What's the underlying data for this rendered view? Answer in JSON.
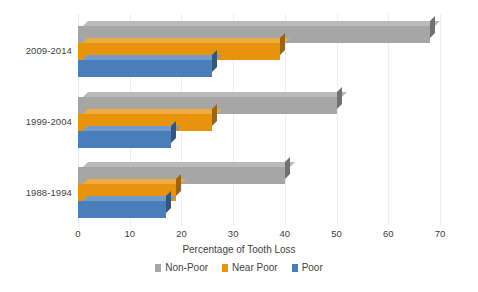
{
  "chart_data": {
    "type": "bar",
    "orientation": "horizontal",
    "title": "",
    "xlabel": "Percentage of Tooth Loss",
    "ylabel": "",
    "xlim": [
      0,
      70
    ],
    "xticks": [
      0,
      10,
      20,
      30,
      40,
      50,
      60,
      70
    ],
    "grid": true,
    "legend_position": "bottom",
    "categories": [
      "2009-2014",
      "1999-2004",
      "1988-1994"
    ],
    "series": [
      {
        "name": "Non-Poor",
        "color": "#a6a6a6",
        "values": [
          68,
          50,
          40
        ]
      },
      {
        "name": "Near Poor",
        "color": "#e8930c",
        "values": [
          39,
          26,
          19
        ]
      },
      {
        "name": "Poor",
        "color": "#4a7ebb",
        "values": [
          26,
          18,
          17
        ]
      }
    ]
  },
  "axis": {
    "tick_labels": [
      "0",
      "10",
      "20",
      "30",
      "40",
      "50",
      "60",
      "70"
    ],
    "title": "Percentage of Tooth Loss"
  },
  "categories": {
    "labels": [
      "2009-2014",
      "1999-2004",
      "1988-1994"
    ]
  },
  "legend": {
    "items": [
      {
        "label": "Non-Poor",
        "color": "#a6a6a6"
      },
      {
        "label": "Near Poor",
        "color": "#e8930c"
      },
      {
        "label": "Poor",
        "color": "#4a7ebb"
      }
    ]
  },
  "colors": {
    "non_poor": "#a6a6a6",
    "near_poor": "#e8930c",
    "poor": "#4a7ebb",
    "gridline": "#eceff1",
    "text": "#3f3f3f",
    "background": "#ffffff"
  }
}
